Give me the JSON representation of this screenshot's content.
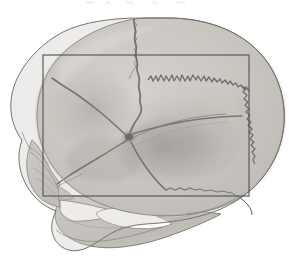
{
  "figure": {
    "title": "Lateral view of human skull with rectangular region of interest",
    "kind": "anatomical-illustration",
    "view": "lateral",
    "subject": "human skull",
    "rendering": "grayscale shaded pencil drawing",
    "background_color": "#ffffff",
    "bone_fill_color": "#c9c9c6",
    "bone_fill_light": "#dedbd6",
    "bone_shadow_color": "#8d8d8a",
    "outline_color": "#6a6a68",
    "suture_color": "#4a4a48",
    "roi_box_color": "#5a5a58"
  },
  "roi": {
    "label": "region-of-interest-rectangle",
    "x": 43,
    "y": 55,
    "width": 206,
    "height": 141,
    "stroke_width": 1.2,
    "filled": false
  },
  "anatomy": {
    "parts": [
      {
        "id": "frontal-bone",
        "label": "Frontal bone"
      },
      {
        "id": "parietal-bone",
        "label": "Parietal bone"
      },
      {
        "id": "occipital-bone",
        "label": "Occipital bone"
      },
      {
        "id": "temporal-bone",
        "label": "Temporal bone"
      },
      {
        "id": "greater-wing-sphenoid",
        "label": "Greater wing of sphenoid"
      },
      {
        "id": "zygomatic-arch",
        "label": "Zygomatic arch"
      },
      {
        "id": "mandible",
        "label": "Mandible"
      },
      {
        "id": "maxilla",
        "label": "Maxilla"
      },
      {
        "id": "nasal-region",
        "label": "Nasal region"
      },
      {
        "id": "mastoid-process",
        "label": "Mastoid process"
      },
      {
        "id": "external-acoustic-meatus",
        "label": "External acoustic meatus"
      }
    ],
    "sutures": [
      {
        "id": "coronal-suture",
        "label": "Coronal suture",
        "style": "wavy"
      },
      {
        "id": "lambdoid-suture",
        "label": "Lambdoid suture",
        "style": "serrated-zigzag"
      },
      {
        "id": "squamosal-suture",
        "label": "Squamosal suture",
        "style": "arched-smooth"
      },
      {
        "id": "sphenofrontal-suture",
        "label": "Sphenofrontal suture",
        "style": "smooth"
      },
      {
        "id": "sphenosquamosal-suture",
        "label": "Sphenosquamosal suture",
        "style": "smooth"
      },
      {
        "id": "occipitomastoid-suture",
        "label": "Occipitomastoid suture",
        "style": "wavy"
      }
    ],
    "landmarks": [
      {
        "id": "pterion",
        "label": "Pterion",
        "x": 129,
        "y": 137,
        "note": "convergence of frontal, parietal, temporal and sphenoid"
      }
    ]
  }
}
